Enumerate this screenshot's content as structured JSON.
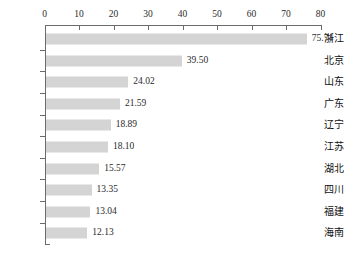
{
  "chart_data": {
    "type": "bar",
    "orientation": "horizontal",
    "title": "",
    "subtitle": "",
    "xlabel": "",
    "ylabel": "",
    "categories": [
      "浙江",
      "北京",
      "山东",
      "广东",
      "辽宁",
      "江苏",
      "湖北",
      "四川",
      "福建",
      "海南"
    ],
    "values": [
      75.74,
      39.5,
      24.02,
      21.59,
      18.89,
      18.1,
      15.57,
      13.35,
      13.04,
      12.13
    ],
    "value_labels": [
      "75.74",
      "39.50",
      "24.02",
      "21.59",
      "18.89",
      "18.10",
      "15.57",
      "13.35",
      "13.04",
      "12.13"
    ],
    "xlim": [
      0,
      80
    ],
    "xticks": [
      0,
      10,
      20,
      30,
      40,
      50,
      60,
      70,
      80
    ],
    "xtick_labels": [
      "0",
      "10",
      "20",
      "30",
      "40",
      "50",
      "60",
      "70",
      "80"
    ],
    "axis_position": "top",
    "grid": false,
    "legend": false,
    "bar_color": "#d4d4d4",
    "axis_color": "#6b6b6b",
    "text_color": "#2b2b2b",
    "background": "#ffffff"
  }
}
